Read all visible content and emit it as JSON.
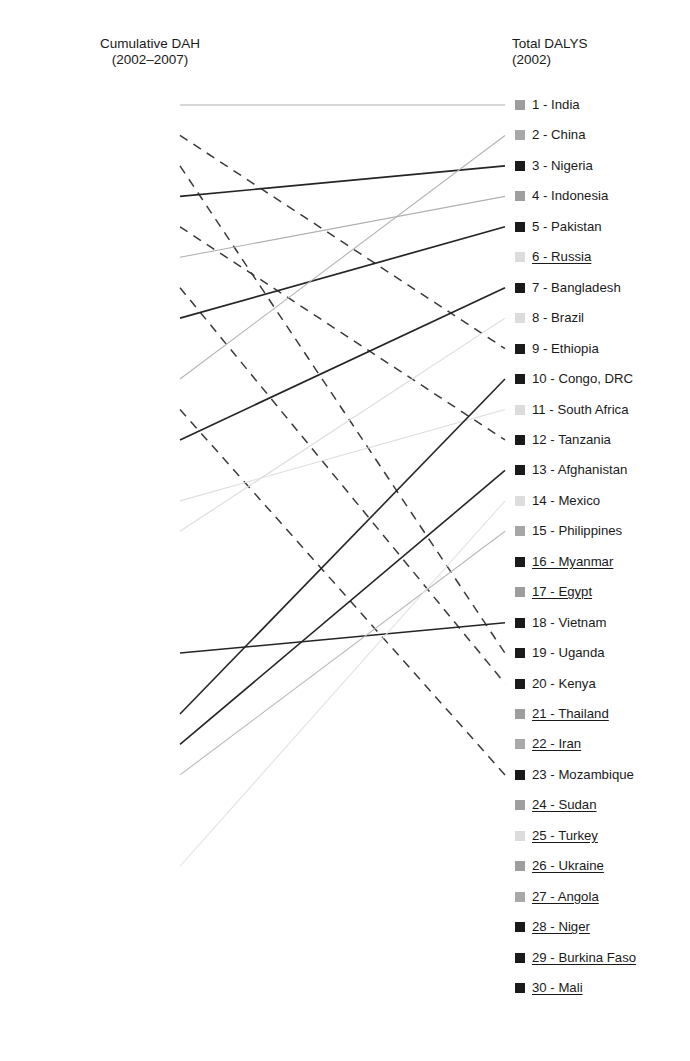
{
  "figure": {
    "type": "slopegraph",
    "left_header": "Cumulative DAH\n(2002–2007)",
    "right_header": "Total DALYS\n(2002)"
  },
  "layout": {
    "first_row_y": 105,
    "row_spacing": 30.45,
    "left_marker_x": 170,
    "right_marker_x": 515,
    "marker_size": 10
  },
  "chart_data": {
    "type": "slopegraph",
    "title": "",
    "left_axis_label": "Cumulative DAH (2002–2007)",
    "right_axis_label": "Total DALYS (2002)",
    "left_categories": [
      "India",
      "Ethiopia",
      "Uganda",
      "Nigeria",
      "Tanzania",
      "Indonesia",
      "Kenya",
      "Pakistan",
      "Zambia",
      "China",
      "Mozambique",
      "Bangladesh",
      "Iraq",
      "South Africa",
      "Brazil",
      "Colombia",
      "Ghana",
      "Argentina",
      "Vietnam",
      "Malawi",
      "Congo, DRC",
      "Afghanistan",
      "Philippines",
      "Rwanda",
      "Cambodia",
      "Mexico",
      "Zimbabwe",
      "Senegal",
      "Haiti",
      "Peru"
    ],
    "right_categories": [
      "India",
      "China",
      "Nigeria",
      "Indonesia",
      "Pakistan",
      "Russia",
      "Bangladesh",
      "Brazil",
      "Ethiopia",
      "Congo, DRC",
      "South Africa",
      "Tanzania",
      "Afghanistan",
      "Mexico",
      "Philippines",
      "Myanmar",
      "Egypt",
      "Vietnam",
      "Uganda",
      "Kenya",
      "Thailand",
      "Iran",
      "Mozambique",
      "Sudan",
      "Turkey",
      "Ukraine",
      "Angola",
      "Niger",
      "Burkina Faso",
      "Mali"
    ],
    "left_nodes": [
      {
        "rank": 1,
        "label": "India - 1",
        "shade": "#9e9e9e",
        "underlined": false
      },
      {
        "rank": 2,
        "label": "Ethiopia - 2",
        "shade": "#1a1a1a",
        "underlined": false
      },
      {
        "rank": 3,
        "label": "Uganda - 3",
        "shade": "#1a1a1a",
        "underlined": false
      },
      {
        "rank": 4,
        "label": "Nigeria - 4",
        "shade": "#1a1a1a",
        "underlined": false
      },
      {
        "rank": 5,
        "label": "Tanzania - 5",
        "shade": "#1a1a1a",
        "underlined": false
      },
      {
        "rank": 6,
        "label": "Indonesia - 6",
        "shade": "#9e9e9e",
        "underlined": false
      },
      {
        "rank": 7,
        "label": "Kenya - 7",
        "shade": "#1a1a1a",
        "underlined": false
      },
      {
        "rank": 8,
        "label": "Pakistan - 8",
        "shade": "#2a2a2a",
        "underlined": false
      },
      {
        "rank": 9,
        "label": "Zambia - 9",
        "shade": "#1f1f1f",
        "underlined": true
      },
      {
        "rank": 10,
        "label": "China - 10",
        "shade": "#9a9a9a",
        "underlined": false
      },
      {
        "rank": 11,
        "label": "Mozambique - 11",
        "shade": "#1a1a1a",
        "underlined": false
      },
      {
        "rank": 12,
        "label": "Bangladesh - 12",
        "shade": "#1a1a1a",
        "underlined": false
      },
      {
        "rank": 13,
        "label": "Iraq - 13",
        "shade": "#b4b4b4",
        "underlined": true
      },
      {
        "rank": 14,
        "label": "South Africa - 14",
        "shade": "#d8d8d8",
        "underlined": false
      },
      {
        "rank": 15,
        "label": "Brazil - 15",
        "shade": "#dcdcdc",
        "underlined": false
      },
      {
        "rank": 16,
        "label": "Colombia - 16",
        "shade": "#8f8f8f",
        "underlined": true
      },
      {
        "rank": 17,
        "label": "Ghana - 17",
        "shade": "#1a1a1a",
        "underlined": true
      },
      {
        "rank": 18,
        "label": "Argentina - 18",
        "shade": "#dcdcdc",
        "underlined": true
      },
      {
        "rank": 19,
        "label": "Vietnam-19",
        "shade": "#1a1a1a",
        "underlined": false
      },
      {
        "rank": 20,
        "label": "Malawi - 20",
        "shade": "#1a1a1a",
        "underlined": true
      },
      {
        "rank": 21,
        "label": "Congo, DRC - 21",
        "shade": "#232323",
        "underlined": false
      },
      {
        "rank": 22,
        "label": "Afghanistan - 22",
        "shade": "#1a1a1a",
        "underlined": false
      },
      {
        "rank": 23,
        "label": "Philippines - 23",
        "shade": "#a6a6a6",
        "underlined": false
      },
      {
        "rank": 24,
        "label": "Rwanda - 24",
        "shade": "#1a1a1a",
        "underlined": true
      },
      {
        "rank": 25,
        "label": "Cambodia - 25",
        "shade": "#202020",
        "underlined": true
      },
      {
        "rank": 26,
        "label": "Mexico - 26",
        "shade": "#d9d9d9",
        "underlined": false
      },
      {
        "rank": 27,
        "label": "Zimbabwe - 27",
        "shade": "#1a1a1a",
        "underlined": true
      },
      {
        "rank": 28,
        "label": "Senegal - 28",
        "shade": "#1a1a1a",
        "underlined": true
      },
      {
        "rank": 29,
        "label": "Haiti- 29",
        "shade": "#1a1a1a",
        "underlined": true
      },
      {
        "rank": 30,
        "label": "Peru- 30",
        "shade": "#9b9b9b",
        "underlined": true
      }
    ],
    "right_nodes": [
      {
        "rank": 1,
        "label": "1 - India",
        "shade": "#9e9e9e",
        "underlined": false
      },
      {
        "rank": 2,
        "label": "2 - China",
        "shade": "#a8a8a8",
        "underlined": false
      },
      {
        "rank": 3,
        "label": "3 - Nigeria",
        "shade": "#1a1a1a",
        "underlined": false
      },
      {
        "rank": 4,
        "label": "4 - Indonesia",
        "shade": "#9e9e9e",
        "underlined": false
      },
      {
        "rank": 5,
        "label": "5 - Pakistan",
        "shade": "#1a1a1a",
        "underlined": false
      },
      {
        "rank": 6,
        "label": "6 - Russia",
        "shade": "#dcdcdc",
        "underlined": true
      },
      {
        "rank": 7,
        "label": "7 - Bangladesh",
        "shade": "#1a1a1a",
        "underlined": false
      },
      {
        "rank": 8,
        "label": "8 - Brazil",
        "shade": "#dcdcdc",
        "underlined": false
      },
      {
        "rank": 9,
        "label": "9 - Ethiopia",
        "shade": "#1a1a1a",
        "underlined": false
      },
      {
        "rank": 10,
        "label": "10 - Congo, DRC",
        "shade": "#1a1a1a",
        "underlined": false
      },
      {
        "rank": 11,
        "label": "11 - South Africa",
        "shade": "#dcdcdc",
        "underlined": false
      },
      {
        "rank": 12,
        "label": "12 - Tanzania",
        "shade": "#1a1a1a",
        "underlined": false
      },
      {
        "rank": 13,
        "label": "13 - Afghanistan",
        "shade": "#1a1a1a",
        "underlined": false
      },
      {
        "rank": 14,
        "label": "14 - Mexico",
        "shade": "#dddddd",
        "underlined": false
      },
      {
        "rank": 15,
        "label": "15 - Philippines",
        "shade": "#a6a6a6",
        "underlined": false
      },
      {
        "rank": 16,
        "label": "16 - Myanmar",
        "shade": "#1a1a1a",
        "underlined": true
      },
      {
        "rank": 17,
        "label": "17 - Egypt",
        "shade": "#9e9e9e",
        "underlined": true
      },
      {
        "rank": 18,
        "label": "18 - Vietnam",
        "shade": "#1a1a1a",
        "underlined": false
      },
      {
        "rank": 19,
        "label": "19 - Uganda",
        "shade": "#1a1a1a",
        "underlined": false
      },
      {
        "rank": 20,
        "label": "20 - Kenya",
        "shade": "#1a1a1a",
        "underlined": false
      },
      {
        "rank": 21,
        "label": "21 - Thailand",
        "shade": "#9e9e9e",
        "underlined": true
      },
      {
        "rank": 22,
        "label": "22 - Iran",
        "shade": "#a8a8a8",
        "underlined": true
      },
      {
        "rank": 23,
        "label": "23 - Mozambique",
        "shade": "#1a1a1a",
        "underlined": false
      },
      {
        "rank": 24,
        "label": "24 - Sudan",
        "shade": "#9e9e9e",
        "underlined": true
      },
      {
        "rank": 25,
        "label": "25 - Turkey",
        "shade": "#dcdcdc",
        "underlined": true
      },
      {
        "rank": 26,
        "label": "26 - Ukraine",
        "shade": "#9e9e9e",
        "underlined": true
      },
      {
        "rank": 27,
        "label": "27 - Angola",
        "shade": "#a8a8a8",
        "underlined": true
      },
      {
        "rank": 28,
        "label": "28 - Niger",
        "shade": "#1a1a1a",
        "underlined": true
      },
      {
        "rank": 29,
        "label": "29 - Burkina Faso",
        "shade": "#1a1a1a",
        "underlined": true
      },
      {
        "rank": 30,
        "label": "30 - Mali",
        "shade": "#1a1a1a",
        "underlined": true
      }
    ],
    "links": [
      {
        "country": "India",
        "from": 1,
        "to": 1,
        "style": "solid",
        "color": "#b0b0b0",
        "width": 1.0
      },
      {
        "country": "Ethiopia",
        "from": 2,
        "to": 9,
        "style": "dashed",
        "color": "#3a3a3a",
        "width": 1.5
      },
      {
        "country": "Uganda",
        "from": 3,
        "to": 19,
        "style": "dashed",
        "color": "#3a3a3a",
        "width": 1.5
      },
      {
        "country": "Nigeria",
        "from": 4,
        "to": 3,
        "style": "solid",
        "color": "#252525",
        "width": 1.7
      },
      {
        "country": "Tanzania",
        "from": 5,
        "to": 12,
        "style": "dashed",
        "color": "#3a3a3a",
        "width": 1.5
      },
      {
        "country": "Indonesia",
        "from": 6,
        "to": 4,
        "style": "solid",
        "color": "#b0b0b0",
        "width": 1.1
      },
      {
        "country": "Kenya",
        "from": 7,
        "to": 20,
        "style": "dashed",
        "color": "#3a3a3a",
        "width": 1.5
      },
      {
        "country": "Pakistan",
        "from": 8,
        "to": 5,
        "style": "solid",
        "color": "#252525",
        "width": 1.7
      },
      {
        "country": "China",
        "from": 10,
        "to": 2,
        "style": "solid",
        "color": "#b4b4b4",
        "width": 1.1
      },
      {
        "country": "Mozambique",
        "from": 11,
        "to": 23,
        "style": "dashed",
        "color": "#3a3a3a",
        "width": 1.5
      },
      {
        "country": "Bangladesh",
        "from": 12,
        "to": 7,
        "style": "solid",
        "color": "#252525",
        "width": 1.7
      },
      {
        "country": "South Africa",
        "from": 14,
        "to": 11,
        "style": "solid",
        "color": "#dcdcdc",
        "width": 1.1
      },
      {
        "country": "Brazil",
        "from": 15,
        "to": 8,
        "style": "solid",
        "color": "#dcdcdc",
        "width": 1.1
      },
      {
        "country": "Vietnam",
        "from": 19,
        "to": 18,
        "style": "solid",
        "color": "#252525",
        "width": 1.5
      },
      {
        "country": "Congo, DRC",
        "from": 21,
        "to": 10,
        "style": "solid",
        "color": "#252525",
        "width": 1.6
      },
      {
        "country": "Afghanistan",
        "from": 22,
        "to": 13,
        "style": "solid",
        "color": "#252525",
        "width": 1.6
      },
      {
        "country": "Philippines",
        "from": 23,
        "to": 15,
        "style": "solid",
        "color": "#b8b8b8",
        "width": 1.1
      },
      {
        "country": "Mexico",
        "from": 26,
        "to": 14,
        "style": "solid",
        "color": "#e2e2e2",
        "width": 1.1
      }
    ]
  }
}
